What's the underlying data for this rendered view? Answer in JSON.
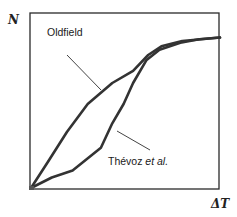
{
  "chart_data": {
    "type": "line",
    "title": "",
    "xlabel": "ΔT",
    "ylabel": "N",
    "grid": false,
    "legend_position": "inline annotations with leader lines",
    "axis_ticks": "none",
    "x_range": [
      0,
      1
    ],
    "y_range": [
      0,
      1
    ],
    "series": [
      {
        "name": "Oldfield",
        "label": "Oldfield",
        "x": [
          0.0,
          0.09,
          0.19,
          0.3,
          0.43,
          0.54,
          0.62,
          0.69,
          0.8,
          1.0
        ],
        "y": [
          0.0,
          0.15,
          0.32,
          0.48,
          0.6,
          0.67,
          0.76,
          0.81,
          0.84,
          0.86
        ]
      },
      {
        "name": "Thévoz et al.",
        "label_main": "Thévoz ",
        "label_italic": "et al.",
        "x": [
          0.0,
          0.11,
          0.22,
          0.37,
          0.43,
          0.49,
          0.54,
          0.61,
          0.68,
          0.79,
          0.89,
          1.0
        ],
        "y": [
          0.0,
          0.06,
          0.1,
          0.23,
          0.37,
          0.48,
          0.6,
          0.73,
          0.79,
          0.83,
          0.85,
          0.86
        ]
      }
    ],
    "annotations": [
      {
        "text": "Oldfield",
        "leader_from": [
          0.2,
          0.75
        ],
        "leader_to": [
          0.37,
          0.56
        ]
      },
      {
        "text": "Thévoz et al.",
        "leader_from": [
          0.46,
          0.33
        ],
        "leader_to": [
          0.63,
          0.22
        ]
      }
    ]
  },
  "labels": {
    "y_axis": "N",
    "x_axis": "ΔT",
    "oldfield": "Oldfield",
    "thevoz_main": "Thévoz ",
    "thevoz_italic": "et al."
  },
  "colors": {
    "curve": "#333333",
    "frame": "#2a2a2a",
    "leader": "#444444"
  }
}
